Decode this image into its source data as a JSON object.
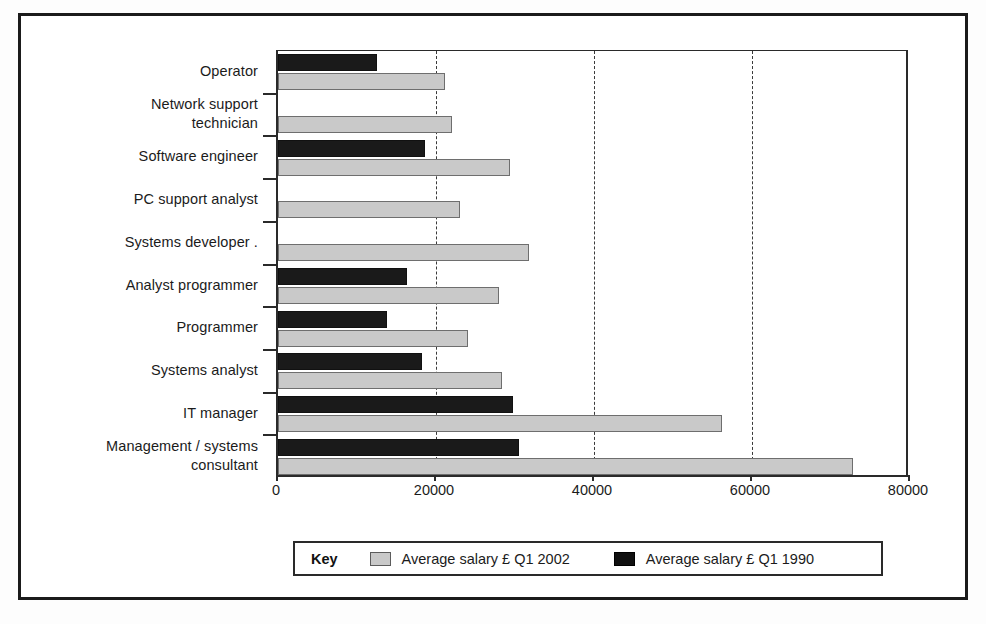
{
  "legend": {
    "title": "Key",
    "entries": [
      {
        "label": "Average salary £ Q1 2002",
        "swatch": "light",
        "color": "#c9c9c9"
      },
      {
        "label": "Average salary £ Q1 1990",
        "swatch": "dark",
        "color": "#101010"
      }
    ]
  },
  "axis": {
    "x_ticks": [
      "0",
      "20000",
      "40000",
      "60000",
      "80000"
    ],
    "gridlines": [
      "20000",
      "40000",
      "60000"
    ]
  },
  "chart_data": {
    "type": "bar",
    "orientation": "horizontal",
    "title": "",
    "subtitle": "",
    "xlabel": "",
    "ylabel": "",
    "xlim": [
      0,
      80000
    ],
    "xticks": [
      0,
      20000,
      40000,
      60000,
      80000
    ],
    "grid": "vertical-dashed-at-20000-40000-60000",
    "legend_position": "bottom",
    "categories": [
      "Operator",
      "Network support technician",
      "Software engineer",
      "PC support analyst",
      "Systems developer .",
      "Analyst programmer",
      "Programmer",
      "Systems analyst",
      "IT manager",
      "Management / systems consultant"
    ],
    "category_label_lines": [
      [
        "Operator"
      ],
      [
        "Network support",
        "technician"
      ],
      [
        "Software engineer"
      ],
      [
        "PC support analyst"
      ],
      [
        "Systems developer ."
      ],
      [
        "Analyst programmer"
      ],
      [
        "Programmer"
      ],
      [
        "Systems analyst"
      ],
      [
        "IT manager"
      ],
      [
        "Management / systems",
        "consultant"
      ]
    ],
    "series": [
      {
        "name": "Average salary £ Q1 1990",
        "color": "#101010",
        "values": [
          12500,
          null,
          18600,
          null,
          null,
          16300,
          13800,
          18200,
          29800,
          30500
        ]
      },
      {
        "name": "Average salary £ Q1 2002",
        "color": "#c9c9c9",
        "values": [
          21200,
          22000,
          29400,
          23000,
          31800,
          28000,
          24000,
          28400,
          56200,
          72800
        ]
      }
    ]
  }
}
